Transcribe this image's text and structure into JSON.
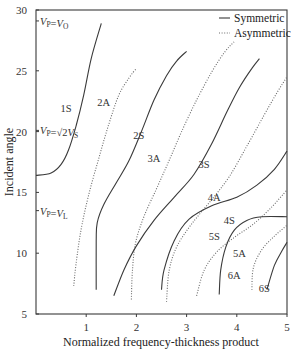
{
  "chart_data": {
    "type": "line",
    "title": "",
    "xlabel": "Normalized frequency-thickness product",
    "ylabel": "Incident angle",
    "xlim": [
      0,
      5
    ],
    "ylim": [
      5,
      30
    ],
    "xticks": [
      1,
      2,
      3,
      4,
      5
    ],
    "yticks": [
      5,
      10,
      15,
      20,
      25,
      30
    ],
    "grid": false,
    "legend": {
      "position": "upper right",
      "entries": [
        {
          "label": "Symmetric",
          "style": "solid"
        },
        {
          "label": "Asymmetric",
          "style": "dotted"
        }
      ]
    },
    "reference_lines": [
      {
        "label": "V_P = V_O",
        "y": 29.1
      },
      {
        "label": "V_P = √2 V_S",
        "y": 20.1
      },
      {
        "label": "V_P = V_L",
        "y": 13.5
      }
    ],
    "series": [
      {
        "name": "1S",
        "style": "solid",
        "label_pos": [
          0.6,
          21.6
        ],
        "points": [
          [
            0,
            16.4
          ],
          [
            0.3,
            16.6
          ],
          [
            0.5,
            17.3
          ],
          [
            0.65,
            18.5
          ],
          [
            0.8,
            20.5
          ],
          [
            0.95,
            23
          ],
          [
            1.1,
            26
          ],
          [
            1.3,
            28.9
          ]
        ]
      },
      {
        "name": "2A",
        "style": "dotted",
        "label_pos": [
          1.35,
          22.1
        ],
        "points": [
          [
            0.75,
            7.3
          ],
          [
            0.8,
            9.2
          ],
          [
            0.9,
            12
          ],
          [
            1.05,
            14.8
          ],
          [
            1.25,
            17.8
          ],
          [
            1.45,
            20.6
          ],
          [
            1.65,
            23
          ],
          [
            1.85,
            24.4
          ],
          [
            2.0,
            25.2
          ]
        ]
      },
      {
        "name": "2S",
        "style": "solid",
        "label_pos": [
          2.05,
          19.4
        ],
        "points": [
          [
            1.2,
            7
          ],
          [
            1.2,
            11
          ],
          [
            1.22,
            12.5
          ],
          [
            1.35,
            14
          ],
          [
            1.6,
            15.8
          ],
          [
            1.85,
            17.6
          ],
          [
            2.1,
            20
          ],
          [
            2.35,
            22.6
          ],
          [
            2.6,
            24.6
          ],
          [
            2.8,
            25.8
          ],
          [
            3.0,
            26.6
          ]
        ]
      },
      {
        "name": "3A",
        "style": "dotted",
        "label_pos": [
          2.35,
          17.5
        ],
        "points": [
          [
            1.9,
            6.2
          ],
          [
            1.92,
            8.5
          ],
          [
            1.98,
            10.8
          ],
          [
            2.15,
            13
          ],
          [
            2.4,
            15.3
          ],
          [
            2.65,
            17.6
          ],
          [
            2.9,
            20
          ],
          [
            3.2,
            22.6
          ],
          [
            3.5,
            24.9
          ],
          [
            3.75,
            26.5
          ],
          [
            3.95,
            27.4
          ]
        ]
      },
      {
        "name": "3S",
        "style": "solid",
        "label_pos": [
          3.35,
          17.0
        ],
        "points": [
          [
            1.55,
            6.5
          ],
          [
            1.75,
            8.6
          ],
          [
            2.0,
            10.6
          ],
          [
            2.35,
            12.7
          ],
          [
            2.75,
            14.6
          ],
          [
            3.15,
            16.5
          ],
          [
            3.5,
            19
          ],
          [
            3.8,
            21.6
          ],
          [
            4.05,
            23.6
          ],
          [
            4.3,
            25.2
          ],
          [
            4.45,
            26
          ]
        ]
      },
      {
        "name": "4A",
        "style": "dotted",
        "label_pos": [
          3.55,
          14.3
        ],
        "points": [
          [
            2.6,
            6
          ],
          [
            2.65,
            8.5
          ],
          [
            2.8,
            10.5
          ],
          [
            3.1,
            12.4
          ],
          [
            3.5,
            14.4
          ],
          [
            3.85,
            16.3
          ],
          [
            4.2,
            18.8
          ],
          [
            4.55,
            21.4
          ],
          [
            4.8,
            23.2
          ],
          [
            5.0,
            24.5
          ]
        ]
      },
      {
        "name": "4S",
        "style": "solid",
        "label_pos": [
          3.85,
          12.4
        ],
        "points": [
          [
            2.5,
            7
          ],
          [
            2.55,
            8.6
          ],
          [
            2.75,
            11
          ],
          [
            3.05,
            12.8
          ],
          [
            3.5,
            13.9
          ],
          [
            4.0,
            14.6
          ],
          [
            4.4,
            15.6
          ],
          [
            4.75,
            16.9
          ],
          [
            5.0,
            18.4
          ]
        ]
      },
      {
        "name": "5A",
        "style": "dotted",
        "label_pos": [
          4.05,
          9.7
        ],
        "points": [
          [
            3.2,
            6.5
          ],
          [
            3.35,
            8.6
          ],
          [
            3.6,
            10.1
          ],
          [
            3.95,
            11.3
          ],
          [
            4.3,
            12.3
          ],
          [
            4.65,
            13.6
          ],
          [
            5.0,
            15.2
          ]
        ]
      },
      {
        "name": "5S",
        "style": "solid",
        "label_pos": [
          3.55,
          11.1
        ],
        "points": [
          [
            3.65,
            6.6
          ],
          [
            3.68,
            8.6
          ],
          [
            3.78,
            10.5
          ],
          [
            3.95,
            11.9
          ],
          [
            4.2,
            12.7
          ],
          [
            4.5,
            13
          ],
          [
            5.0,
            13
          ]
        ]
      },
      {
        "name": "6A",
        "style": "dotted",
        "label_pos": [
          3.95,
          7.9
        ],
        "points": [
          [
            4.3,
            7
          ],
          [
            4.33,
            8.8
          ],
          [
            4.5,
            10.3
          ],
          [
            4.75,
            11.4
          ],
          [
            5.0,
            12.3
          ]
        ]
      },
      {
        "name": "6S",
        "style": "solid",
        "label_pos": [
          4.55,
          6.8
        ],
        "points": [
          [
            4.6,
            7
          ],
          [
            4.75,
            9
          ],
          [
            4.9,
            10.2
          ],
          [
            5.0,
            10.9
          ]
        ]
      }
    ]
  }
}
